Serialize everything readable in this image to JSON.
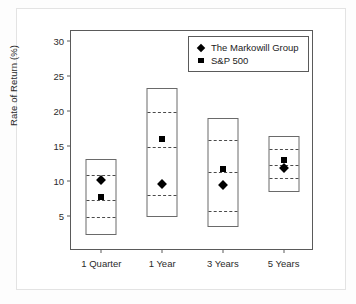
{
  "chart_data": {
    "type": "box",
    "title": "",
    "xlabel": "",
    "ylabel": "Rate of Return (%)",
    "ylim": [
      0,
      31.5
    ],
    "yticks": [
      5,
      10,
      15,
      20,
      25,
      30
    ],
    "ytick_labels": [
      "5",
      "10",
      "15",
      "20",
      "25",
      "30"
    ],
    "grid": false,
    "legend_position": "top-right",
    "categories": [
      "1 Quarter",
      "1 Year",
      "3 Years",
      "5 Years"
    ],
    "legend": [
      {
        "label": "The Markowill Group",
        "marker": "diamond",
        "color": "#000000"
      },
      {
        "label": "S&P 500",
        "marker": "square",
        "color": "#000000"
      }
    ],
    "boxes": [
      {
        "category": "1 Quarter",
        "max": 13.2,
        "q3": 11.0,
        "median": 7.5,
        "q1": 5.0,
        "min": 2.3
      },
      {
        "category": "1 Year",
        "max": 23.3,
        "q3": 20.0,
        "median": 15.0,
        "q1": 8.2,
        "min": 4.8
      },
      {
        "category": "3 Years",
        "max": 19.0,
        "q3": 16.0,
        "median": 11.5,
        "q1": 5.8,
        "min": 3.4
      },
      {
        "category": "5 Years",
        "max": 16.5,
        "q3": 14.8,
        "median": 12.5,
        "q1": 10.6,
        "min": 8.5
      }
    ],
    "series": [
      {
        "name": "The Markowill Group",
        "marker": "diamond",
        "values": [
          10.2,
          9.6,
          9.5,
          11.9
        ]
      },
      {
        "name": "S&P 500",
        "marker": "square",
        "values": [
          7.8,
          16.0,
          11.8,
          13.0
        ]
      }
    ]
  },
  "axis": {
    "y_label": "Rate of Return (%)"
  }
}
